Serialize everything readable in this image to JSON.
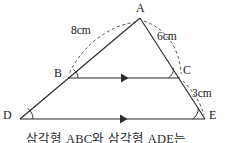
{
  "figure": {
    "type": "geometry-diagram",
    "stroke_color": "#2b2b2b",
    "dashed_color": "#4d4d4d",
    "background": "#ffffff",
    "vertices": [
      {
        "id": "A",
        "label": "A",
        "x": 140,
        "y": 18,
        "label_x": 136,
        "label_y": 3
      },
      {
        "id": "B",
        "label": "B",
        "x": 68,
        "y": 78,
        "label_x": 54,
        "label_y": 68
      },
      {
        "id": "C",
        "label": "C",
        "x": 180,
        "y": 78,
        "label_x": 182,
        "label_y": 65
      },
      {
        "id": "D",
        "label": "D",
        "x": 20,
        "y": 119,
        "label_x": 3,
        "label_y": 110
      },
      {
        "id": "E",
        "label": "E",
        "x": 205,
        "y": 119,
        "label_x": 208,
        "label_y": 110
      }
    ],
    "segments": [
      {
        "name": "AD",
        "from": "A",
        "to": "D",
        "style": "solid"
      },
      {
        "name": "AE",
        "from": "A",
        "to": "E",
        "style": "solid"
      },
      {
        "name": "BC",
        "from": "B",
        "to": "C",
        "style": "solid",
        "parallel_marks": 1
      },
      {
        "name": "DE",
        "from": "D",
        "to": "E",
        "style": "solid",
        "parallel_marks": 1
      }
    ],
    "measure_labels": [
      {
        "id": "ab",
        "text": "8cm",
        "x": 72,
        "y": 26,
        "measures": "AB"
      },
      {
        "id": "ac",
        "text": "6cm",
        "x": 157,
        "y": 31,
        "measures": "AC"
      },
      {
        "id": "ce",
        "text": "3cm",
        "x": 193,
        "y": 88,
        "measures": "CE"
      }
    ],
    "measure_arcs": [
      {
        "id": "arc-ab",
        "label_ref": "ab"
      },
      {
        "id": "arc-ac",
        "label_ref": "ac"
      },
      {
        "id": "arc-ce",
        "label_ref": "ce"
      }
    ],
    "angle_marks": [
      {
        "id": "angle-b",
        "at": "B"
      },
      {
        "id": "angle-c",
        "at": "C"
      },
      {
        "id": "angle-d",
        "at": "D"
      },
      {
        "id": "angle-e",
        "at": "E"
      }
    ]
  },
  "caption": {
    "text": "삼각형 ABC와 삼각형 ADE는"
  }
}
